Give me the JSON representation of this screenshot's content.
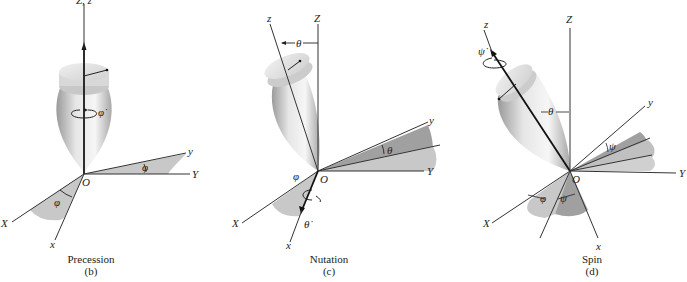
{
  "panels": [
    {
      "id": "b",
      "caption": "Precession",
      "sublabel": "(b)",
      "axis_labels": {
        "Zz": "Z, z",
        "y": "y",
        "Y": "Y",
        "X": "X",
        "x": "x",
        "O": "O"
      },
      "angle_labels": {
        "rate": "φ̇",
        "angle_yY": "φ",
        "angle_Xx": "φ"
      }
    },
    {
      "id": "c",
      "caption": "Nutation",
      "sublabel": "(c)",
      "axis_labels": {
        "z": "z",
        "Z": "Z",
        "y": "y",
        "Y": "Y",
        "X": "X",
        "x": "x",
        "O": "O"
      },
      "angle_labels": {
        "theta_top": "θ",
        "theta_y": "θ",
        "phi": "φ",
        "rate": "θ̇"
      }
    },
    {
      "id": "d",
      "caption": "Spin",
      "sublabel": "(d)",
      "axis_labels": {
        "z": "z",
        "Z": "Z",
        "y": "y",
        "Y": "Y",
        "X": "X",
        "x": "x",
        "O": "O"
      },
      "angle_labels": {
        "rate": "ψ̇",
        "theta": "θ",
        "psi_y": "ψ",
        "phi": "φ",
        "psi_x": "ψ"
      }
    }
  ]
}
